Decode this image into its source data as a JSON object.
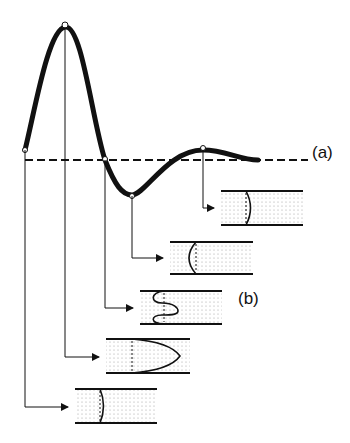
{
  "labels": {
    "curve_label": "(a)",
    "tubes_label": "(b)"
  },
  "colors": {
    "stroke": "#111111",
    "dots": "#9a9a9a",
    "background": "#ffffff"
  },
  "curve": {
    "description": "damped oscillation curve with key points",
    "key_points": [
      {
        "name": "start",
        "x": 25,
        "y": 150
      },
      {
        "name": "peak",
        "x": 65,
        "y": 27
      },
      {
        "name": "zero-crossing",
        "x": 105,
        "y": 160
      },
      {
        "name": "trough",
        "x": 132,
        "y": 195
      },
      {
        "name": "small-hump",
        "x": 203,
        "y": 150
      }
    ],
    "baseline_y": 160
  },
  "tubes": [
    {
      "id": 1,
      "front": "slightly-curved-concave",
      "source_point": "small-hump"
    },
    {
      "id": 2,
      "front": "curved-concave",
      "source_point": "trough"
    },
    {
      "id": 3,
      "front": "s-wave",
      "source_point": "zero-crossing"
    },
    {
      "id": 4,
      "front": "parabolic",
      "source_point": "peak"
    },
    {
      "id": 5,
      "front": "slightly-curved-concave",
      "source_point": "start"
    }
  ]
}
